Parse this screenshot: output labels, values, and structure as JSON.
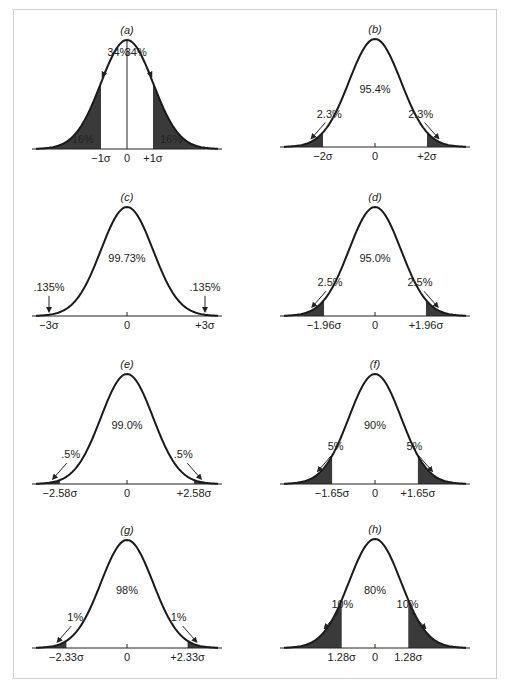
{
  "figure": {
    "frame_color": "#cfcfcf",
    "curve_color": "#1a1a1a",
    "shade_color": "#3a3a3a",
    "axis_color": "#222222"
  },
  "chart_data": [
    {
      "id": "a",
      "title": "(a)",
      "type": "area",
      "description": "Normal curve, shaded tails beyond ±1σ",
      "cut_sigma": 1.0,
      "shaded": "tails",
      "center_label": "",
      "center_line": true,
      "tail_labels": [
        "34%",
        "34%"
      ],
      "tail_label_role": "area between 0 and ±1σ",
      "inner_tail_labels": [
        "16%",
        "16%"
      ],
      "tick_labels": [
        "−1σ",
        "0",
        "+1σ"
      ],
      "values": {
        "center_percent": 68,
        "each_tail_percent": 16,
        "each_half_percent": 34
      }
    },
    {
      "id": "b",
      "title": "(b)",
      "type": "area",
      "description": "Normal curve, shaded tails beyond ±2σ",
      "cut_sigma": 2.0,
      "shaded": "tails",
      "center_label": "95.4%",
      "tail_labels": [
        "2.3%",
        "2.3%"
      ],
      "tick_labels": [
        "−2σ",
        "0",
        "+2σ"
      ],
      "values": {
        "center_percent": 95.4,
        "each_tail_percent": 2.3
      }
    },
    {
      "id": "c",
      "title": "(c)",
      "type": "area",
      "description": "Normal curve, shaded tails beyond ±3σ",
      "cut_sigma": 3.0,
      "shaded": "tails",
      "center_label": "99.73%",
      "tail_labels": [
        ".135%",
        ".135%"
      ],
      "tick_labels": [
        "−3σ",
        "0",
        "+3σ"
      ],
      "values": {
        "center_percent": 99.73,
        "each_tail_percent": 0.135
      }
    },
    {
      "id": "d",
      "title": "(d)",
      "type": "area",
      "description": "Normal curve, shaded tails beyond ±1.96σ",
      "cut_sigma": 1.96,
      "shaded": "tails",
      "center_label": "95.0%",
      "tail_labels": [
        "2.5%",
        "2.5%"
      ],
      "tick_labels": [
        "−1.96σ",
        "0",
        "+1.96σ"
      ],
      "values": {
        "center_percent": 95.0,
        "each_tail_percent": 2.5
      }
    },
    {
      "id": "e",
      "title": "(e)",
      "type": "area",
      "description": "Normal curve, shaded tails beyond ±2.58σ",
      "cut_sigma": 2.58,
      "shaded": "tails",
      "center_label": "99.0%",
      "tail_labels": [
        ".5%",
        ".5%"
      ],
      "tick_labels": [
        "−2.58σ",
        "0",
        "+2.58σ"
      ],
      "values": {
        "center_percent": 99.0,
        "each_tail_percent": 0.5
      }
    },
    {
      "id": "f",
      "title": "(f)",
      "type": "area",
      "description": "Normal curve, shaded tails beyond ±1.65σ",
      "cut_sigma": 1.65,
      "shaded": "tails",
      "center_label": "90%",
      "tail_labels": [
        "5%",
        "5%"
      ],
      "tick_labels": [
        "−1.65σ",
        "0",
        "+1.65σ"
      ],
      "values": {
        "center_percent": 90,
        "each_tail_percent": 5
      }
    },
    {
      "id": "g",
      "title": "(g)",
      "type": "area",
      "description": "Normal curve, shaded tails beyond ±2.33σ",
      "cut_sigma": 2.33,
      "shaded": "tails",
      "center_label": "98%",
      "tail_labels": [
        "1%",
        "1%"
      ],
      "tick_labels": [
        "−2.33σ",
        "0",
        "+2.33σ"
      ],
      "values": {
        "center_percent": 98,
        "each_tail_percent": 1
      }
    },
    {
      "id": "h",
      "title": "(h)",
      "type": "area",
      "description": "Normal curve, shaded tails beyond ±1.28σ",
      "cut_sigma": 1.28,
      "shaded": "tails",
      "center_label": "80%",
      "tail_labels": [
        "10%",
        "10%"
      ],
      "tick_labels": [
        "1.28σ",
        "0",
        "1.28σ"
      ],
      "values": {
        "center_percent": 80,
        "each_tail_percent": 10
      }
    }
  ],
  "layout": {
    "panels": [
      {
        "cx": 127,
        "axis_y": 149,
        "peak_y": 40
      },
      {
        "cx": 375,
        "axis_y": 147,
        "peak_y": 39
      },
      {
        "cx": 127,
        "axis_y": 316,
        "peak_y": 207
      },
      {
        "cx": 375,
        "axis_y": 316,
        "peak_y": 207
      },
      {
        "cx": 127,
        "axis_y": 484,
        "peak_y": 374
      },
      {
        "cx": 375,
        "axis_y": 484,
        "peak_y": 374
      },
      {
        "cx": 127,
        "axis_y": 648,
        "peak_y": 540
      },
      {
        "cx": 375,
        "axis_y": 648,
        "peak_y": 539
      }
    ],
    "sigma_px": 26,
    "range_sigma": 3.5
  }
}
